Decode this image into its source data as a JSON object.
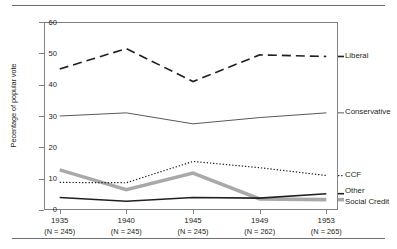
{
  "chart_data": {
    "type": "line",
    "title": "",
    "xlabel": "",
    "ylabel": "Pecentage of popular vote",
    "categories": [
      "1935",
      "1940",
      "1945",
      "1949",
      "1953"
    ],
    "category_sublabels": [
      "(N = 245)",
      "(N = 245)",
      "(N = 245)",
      "(N = 262)",
      "(N = 265)"
    ],
    "ylim": [
      0,
      60
    ],
    "yticks": [
      0,
      10,
      20,
      30,
      40,
      50,
      60
    ],
    "grid": false,
    "legend_position": "right-inline",
    "series": [
      {
        "name": "Liberal",
        "style": "dashed",
        "color": "#231f20",
        "width": 1.6,
        "values": [
          45.0,
          51.5,
          41.0,
          49.5,
          49.0
        ]
      },
      {
        "name": "Conservative",
        "style": "solid-thin",
        "color": "#58595b",
        "width": 1.0,
        "values": [
          30.0,
          31.0,
          27.5,
          29.5,
          31.0
        ]
      },
      {
        "name": "CCF",
        "style": "dotted",
        "color": "#231f20",
        "width": 1.2,
        "values": [
          8.8,
          8.7,
          15.5,
          13.5,
          11.0
        ]
      },
      {
        "name": "Other",
        "style": "solid-medium",
        "color": "#231f20",
        "width": 1.6,
        "values": [
          4.0,
          2.8,
          4.0,
          3.8,
          5.2
        ]
      },
      {
        "name": "Social Credit",
        "style": "solid-thick-gray",
        "color": "#a7a9ac",
        "width": 3.6,
        "values": [
          12.8,
          6.5,
          11.8,
          3.5,
          3.3
        ]
      }
    ]
  },
  "axis": {
    "y_tick_labels": [
      "60",
      "50",
      "40",
      "30",
      "20",
      "10",
      "0"
    ]
  },
  "legend": {
    "liberal": "Liberal",
    "conservative": "Conservative",
    "ccf": "CCF",
    "other": "Other",
    "social_credit": "Social Credit"
  }
}
